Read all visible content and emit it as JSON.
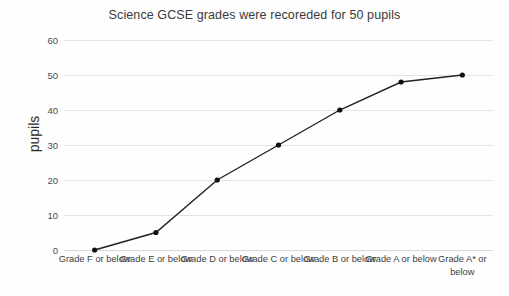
{
  "chart_data": {
    "type": "line",
    "title": "Science GCSE grades were recoreded for 50 pupils",
    "xlabel": "",
    "ylabel": "pupils",
    "categories": [
      "Grade F or below",
      "Grade E or below",
      "Grade D or below",
      "Grade C or below",
      "Grade B or below",
      "Grade A or below",
      "Grade A* or below"
    ],
    "values": [
      0,
      5,
      20,
      30,
      40,
      48,
      50
    ],
    "ylim": [
      0,
      60
    ],
    "yticks": [
      0,
      10,
      20,
      30,
      40,
      50,
      60
    ],
    "ytick_labels": [
      "0",
      "10",
      "20",
      "30",
      "40",
      "50",
      "60"
    ],
    "grid": "horizontal",
    "legend": "none",
    "series": [
      {
        "name": "pupils",
        "values": [
          0,
          5,
          20,
          30,
          40,
          48,
          50
        ],
        "line_color": "#222222",
        "marker": "circle",
        "marker_color": "#111111"
      }
    ],
    "colors": {
      "background": "#fefefe",
      "gridline": "#e3e3e3",
      "line": "#222222",
      "marker": "#111111",
      "title_text": "#3a3a3a",
      "tick_text": "#4a4a4a"
    }
  }
}
